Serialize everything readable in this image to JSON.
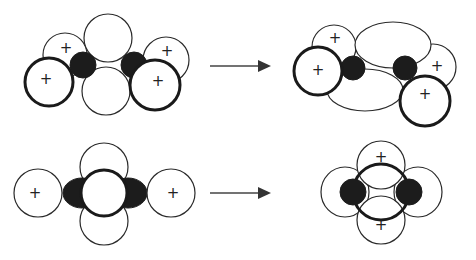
{
  "diagram": {
    "type": "orbital-interaction-diagram",
    "colors": {
      "background": "#ffffff",
      "outline": "#1a1a1a",
      "filled_lobe": "#1c1c1c",
      "arrow": "#444444"
    },
    "rows": [
      {
        "name": "top-row",
        "left_panel": {
          "description": "two carbon centers with four substituent orbitals and two large central lobes (pre-interaction)",
          "plus_labels": [
            "+",
            "+",
            "+",
            "+"
          ]
        },
        "arrow": "→",
        "right_panel": {
          "description": "twisted geometry with elliptical central lobes",
          "plus_labels": [
            "+",
            "+",
            "+",
            "+"
          ]
        }
      },
      {
        "name": "bottom-row",
        "left_panel": {
          "description": "linear arrangement with central ring, top and bottom lobes, two side orbitals",
          "plus_labels": [
            "+",
            "+"
          ]
        },
        "arrow": "→",
        "right_panel": {
          "description": "central ring with two dark lobes, top/bottom positive lobes and side lobes",
          "plus_labels": [
            "+",
            "+"
          ]
        }
      }
    ]
  }
}
